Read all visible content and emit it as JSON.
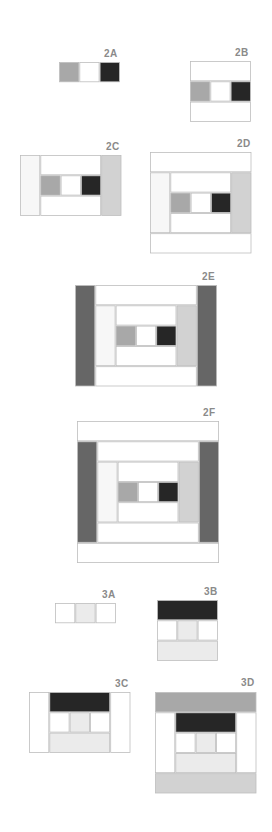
{
  "tones": {
    "white": "#ffffff",
    "very_light": "#f7f7f7",
    "pale": "#ebebeb",
    "light_gray": "#d2d2d2",
    "medium_gray": "#a8a8a8",
    "dark_gray": "#666666",
    "dark": "#262626",
    "outline": "#bdbdbd",
    "label": "#8a8a8a"
  },
  "blocks": [
    {
      "id": "2A",
      "label": "2A",
      "cells": [
        {
          "c": 0,
          "r": 0,
          "w": 1,
          "h": 1,
          "tone": "medium_gray"
        },
        {
          "c": 1,
          "r": 0,
          "w": 1,
          "h": 1,
          "tone": "white"
        },
        {
          "c": 2,
          "r": 0,
          "w": 1,
          "h": 1,
          "tone": "dark"
        }
      ]
    },
    {
      "id": "2B",
      "label": "2B",
      "cells": [
        {
          "c": 0,
          "r": 0,
          "w": 3,
          "h": 1,
          "tone": "white"
        },
        {
          "c": 0,
          "r": 1,
          "w": 1,
          "h": 1,
          "tone": "medium_gray"
        },
        {
          "c": 1,
          "r": 1,
          "w": 1,
          "h": 1,
          "tone": "white"
        },
        {
          "c": 2,
          "r": 1,
          "w": 1,
          "h": 1,
          "tone": "dark"
        },
        {
          "c": 0,
          "r": 2,
          "w": 3,
          "h": 1,
          "tone": "white"
        }
      ]
    },
    {
      "id": "2C",
      "label": "2C",
      "cells": [
        {
          "c": 0,
          "r": 0,
          "w": 1,
          "h": 3,
          "tone": "very_light"
        },
        {
          "c": 1,
          "r": 0,
          "w": 3,
          "h": 1,
          "tone": "white"
        },
        {
          "c": 1,
          "r": 1,
          "w": 1,
          "h": 1,
          "tone": "medium_gray"
        },
        {
          "c": 2,
          "r": 1,
          "w": 1,
          "h": 1,
          "tone": "white"
        },
        {
          "c": 3,
          "r": 1,
          "w": 1,
          "h": 1,
          "tone": "dark"
        },
        {
          "c": 1,
          "r": 2,
          "w": 3,
          "h": 1,
          "tone": "white"
        },
        {
          "c": 4,
          "r": 0,
          "w": 1,
          "h": 3,
          "tone": "light_gray"
        }
      ]
    },
    {
      "id": "2D",
      "label": "2D",
      "cells": [
        {
          "c": 0,
          "r": 0,
          "w": 5,
          "h": 1,
          "tone": "white"
        },
        {
          "c": 0,
          "r": 1,
          "w": 1,
          "h": 3,
          "tone": "very_light"
        },
        {
          "c": 1,
          "r": 1,
          "w": 3,
          "h": 1,
          "tone": "white"
        },
        {
          "c": 1,
          "r": 2,
          "w": 1,
          "h": 1,
          "tone": "medium_gray"
        },
        {
          "c": 2,
          "r": 2,
          "w": 1,
          "h": 1,
          "tone": "white"
        },
        {
          "c": 3,
          "r": 2,
          "w": 1,
          "h": 1,
          "tone": "dark"
        },
        {
          "c": 1,
          "r": 3,
          "w": 3,
          "h": 1,
          "tone": "white"
        },
        {
          "c": 4,
          "r": 1,
          "w": 1,
          "h": 3,
          "tone": "light_gray"
        },
        {
          "c": 0,
          "r": 4,
          "w": 5,
          "h": 1,
          "tone": "white"
        }
      ]
    },
    {
      "id": "2E",
      "label": "2E",
      "cells": [
        {
          "c": 0,
          "r": 0,
          "w": 1,
          "h": 5,
          "tone": "dark_gray"
        },
        {
          "c": 1,
          "r": 0,
          "w": 5,
          "h": 1,
          "tone": "white"
        },
        {
          "c": 1,
          "r": 1,
          "w": 1,
          "h": 3,
          "tone": "very_light"
        },
        {
          "c": 2,
          "r": 1,
          "w": 3,
          "h": 1,
          "tone": "white"
        },
        {
          "c": 2,
          "r": 2,
          "w": 1,
          "h": 1,
          "tone": "medium_gray"
        },
        {
          "c": 3,
          "r": 2,
          "w": 1,
          "h": 1,
          "tone": "white"
        },
        {
          "c": 4,
          "r": 2,
          "w": 1,
          "h": 1,
          "tone": "dark"
        },
        {
          "c": 2,
          "r": 3,
          "w": 3,
          "h": 1,
          "tone": "white"
        },
        {
          "c": 5,
          "r": 1,
          "w": 1,
          "h": 3,
          "tone": "light_gray"
        },
        {
          "c": 1,
          "r": 4,
          "w": 5,
          "h": 1,
          "tone": "white"
        },
        {
          "c": 6,
          "r": 0,
          "w": 1,
          "h": 5,
          "tone": "dark_gray"
        }
      ]
    },
    {
      "id": "2F",
      "label": "2F",
      "cells": [
        {
          "c": 0,
          "r": 0,
          "w": 7,
          "h": 1,
          "tone": "white"
        },
        {
          "c": 0,
          "r": 1,
          "w": 1,
          "h": 5,
          "tone": "dark_gray"
        },
        {
          "c": 1,
          "r": 1,
          "w": 5,
          "h": 1,
          "tone": "white"
        },
        {
          "c": 1,
          "r": 2,
          "w": 1,
          "h": 3,
          "tone": "very_light"
        },
        {
          "c": 2,
          "r": 2,
          "w": 3,
          "h": 1,
          "tone": "white"
        },
        {
          "c": 2,
          "r": 3,
          "w": 1,
          "h": 1,
          "tone": "medium_gray"
        },
        {
          "c": 3,
          "r": 3,
          "w": 1,
          "h": 1,
          "tone": "white"
        },
        {
          "c": 4,
          "r": 3,
          "w": 1,
          "h": 1,
          "tone": "dark"
        },
        {
          "c": 2,
          "r": 4,
          "w": 3,
          "h": 1,
          "tone": "white"
        },
        {
          "c": 5,
          "r": 2,
          "w": 1,
          "h": 3,
          "tone": "light_gray"
        },
        {
          "c": 1,
          "r": 5,
          "w": 5,
          "h": 1,
          "tone": "white"
        },
        {
          "c": 6,
          "r": 1,
          "w": 1,
          "h": 5,
          "tone": "dark_gray"
        },
        {
          "c": 0,
          "r": 6,
          "w": 7,
          "h": 1,
          "tone": "white"
        }
      ]
    },
    {
      "id": "3A",
      "label": "3A",
      "cells": [
        {
          "c": 0,
          "r": 0,
          "w": 1,
          "h": 1,
          "tone": "white"
        },
        {
          "c": 1,
          "r": 0,
          "w": 1,
          "h": 1,
          "tone": "pale"
        },
        {
          "c": 2,
          "r": 0,
          "w": 1,
          "h": 1,
          "tone": "white"
        }
      ]
    },
    {
      "id": "3B",
      "label": "3B",
      "cells": [
        {
          "c": 0,
          "r": 0,
          "w": 3,
          "h": 1,
          "tone": "dark"
        },
        {
          "c": 0,
          "r": 1,
          "w": 1,
          "h": 1,
          "tone": "white"
        },
        {
          "c": 1,
          "r": 1,
          "w": 1,
          "h": 1,
          "tone": "pale"
        },
        {
          "c": 2,
          "r": 1,
          "w": 1,
          "h": 1,
          "tone": "white"
        },
        {
          "c": 0,
          "r": 2,
          "w": 3,
          "h": 1,
          "tone": "pale"
        }
      ]
    },
    {
      "id": "3C",
      "label": "3C",
      "cells": [
        {
          "c": 0,
          "r": 0,
          "w": 1,
          "h": 3,
          "tone": "white"
        },
        {
          "c": 1,
          "r": 0,
          "w": 3,
          "h": 1,
          "tone": "dark"
        },
        {
          "c": 1,
          "r": 1,
          "w": 1,
          "h": 1,
          "tone": "white"
        },
        {
          "c": 2,
          "r": 1,
          "w": 1,
          "h": 1,
          "tone": "pale"
        },
        {
          "c": 3,
          "r": 1,
          "w": 1,
          "h": 1,
          "tone": "white"
        },
        {
          "c": 1,
          "r": 2,
          "w": 3,
          "h": 1,
          "tone": "pale"
        },
        {
          "c": 4,
          "r": 0,
          "w": 1,
          "h": 3,
          "tone": "white"
        }
      ]
    },
    {
      "id": "3D",
      "label": "3D",
      "cells": [
        {
          "c": 0,
          "r": 0,
          "w": 5,
          "h": 1,
          "tone": "medium_gray"
        },
        {
          "c": 0,
          "r": 1,
          "w": 1,
          "h": 3,
          "tone": "white"
        },
        {
          "c": 1,
          "r": 1,
          "w": 3,
          "h": 1,
          "tone": "dark"
        },
        {
          "c": 1,
          "r": 2,
          "w": 1,
          "h": 1,
          "tone": "white"
        },
        {
          "c": 2,
          "r": 2,
          "w": 1,
          "h": 1,
          "tone": "pale"
        },
        {
          "c": 3,
          "r": 2,
          "w": 1,
          "h": 1,
          "tone": "white"
        },
        {
          "c": 1,
          "r": 3,
          "w": 3,
          "h": 1,
          "tone": "pale"
        },
        {
          "c": 4,
          "r": 1,
          "w": 1,
          "h": 3,
          "tone": "white"
        },
        {
          "c": 0,
          "r": 4,
          "w": 5,
          "h": 1,
          "tone": "light_gray"
        }
      ]
    }
  ]
}
